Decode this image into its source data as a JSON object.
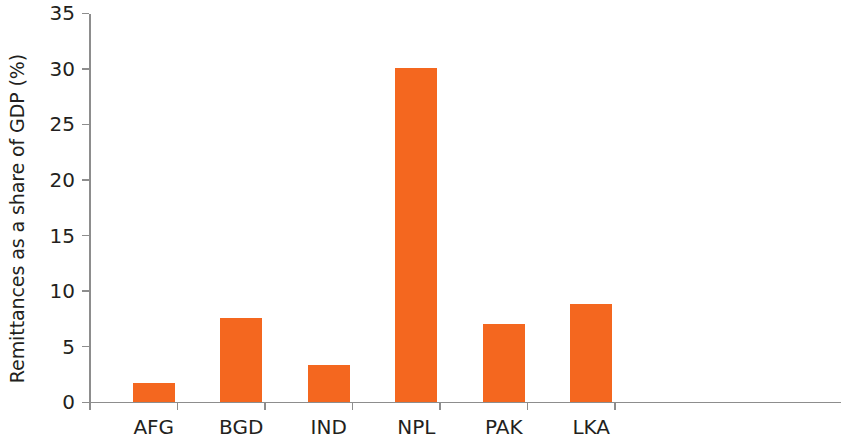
{
  "chart_data": {
    "type": "bar",
    "title": "",
    "xlabel": "",
    "ylabel": "Remittances as a share of GDP (%)",
    "categories": [
      "AFG",
      "BGD",
      "IND",
      "NPL",
      "PAK",
      "LKA"
    ],
    "values": [
      1.7,
      7.5,
      3.3,
      30.0,
      7.0,
      8.8
    ],
    "ylim": [
      0,
      35
    ],
    "yticks": [
      0,
      5,
      10,
      15,
      20,
      25,
      30,
      35
    ],
    "ytick_labels": [
      "0",
      "5",
      "10",
      "15",
      "20",
      "25",
      "30",
      "35"
    ],
    "grid": false,
    "legend": null,
    "bar_color": "#f4671f",
    "axis_color": "#8d8d8d",
    "text_color": "#231f20"
  },
  "axis": {
    "y_title": "Remittances as a share of GDP (%)"
  }
}
